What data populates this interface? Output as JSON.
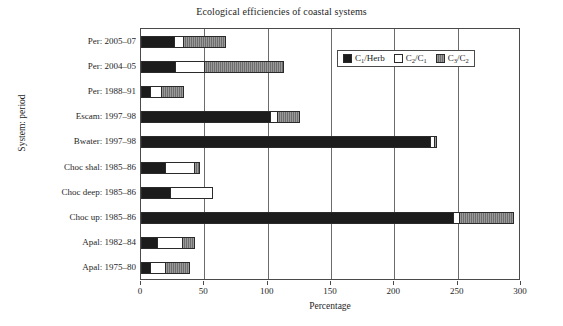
{
  "chart_data": {
    "type": "bar",
    "orientation": "horizontal",
    "stacked": true,
    "title": "Ecological efficiencies of coastal systems",
    "xlabel": "Percentage",
    "ylabel": "System: period",
    "xlim": [
      0,
      300
    ],
    "ylim": null,
    "grid": "vertical",
    "xticks": [
      0,
      50,
      100,
      150,
      200,
      250,
      300
    ],
    "xticklabels": [
      "0",
      "50",
      "100",
      "150",
      "200",
      "250",
      "300"
    ],
    "legend_position": "upper right inside",
    "legend": [
      "C1/Herb",
      "C2/C1",
      "C3/C2"
    ],
    "categories": [
      "Per: 2005–07",
      "Per: 2004–05",
      "Per: 1988–91",
      "Escam: 1997–98",
      "Bwater: 1997–98",
      "Choc shal: 1985–86",
      "Choc deep: 1985–86",
      "Choc up: 1985–86",
      "Apal: 1982–84",
      "Apal: 1975–80"
    ],
    "series": [
      {
        "name": "C1/Herb",
        "color": "#1c1c1c",
        "values": [
          26,
          27,
          7,
          102,
          228,
          19,
          23,
          246,
          13,
          7
        ]
      },
      {
        "name": "C2/C1",
        "color": "#ffffff",
        "values": [
          7,
          23,
          9,
          5,
          3,
          23,
          33,
          5,
          19,
          12
        ]
      },
      {
        "name": "C3/C2",
        "color": "#7f7f7f",
        "values": [
          33,
          62,
          17,
          18,
          2,
          4,
          0,
          43,
          10,
          19
        ]
      }
    ],
    "totals": [
      66,
      112,
      33,
      125,
      233,
      46,
      56,
      294,
      42,
      38
    ]
  },
  "legend_labels": [
    {
      "base": "C",
      "sub": "1",
      "rest": "/Herb",
      "swatch": "c1"
    },
    {
      "base": "C",
      "sub": "2",
      "rest": "/C",
      "rest_sub": "1",
      "swatch": "c2"
    },
    {
      "base": "C",
      "sub": "3",
      "rest": "/C",
      "rest_sub": "2",
      "swatch": "c3"
    }
  ]
}
